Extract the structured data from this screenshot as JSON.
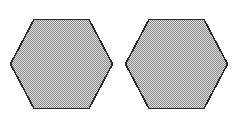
{
  "canvas": {
    "width": 232,
    "height": 116,
    "background_color": "#ffffff"
  },
  "figure": {
    "type": "geometric-shapes",
    "shape_count": 2,
    "shape_name": "hexagon"
  },
  "style": {
    "fill_color": "#b4b4b4",
    "fill_pattern": "checkerboard-dither",
    "dither_light_color": "#d8d8d8",
    "dither_dark_color": "#909090",
    "stroke_color": "#2b2b2b",
    "stroke_width": 1.6
  },
  "shapes": [
    {
      "id": "hexagon-left",
      "label": "Left hexagon",
      "center_x": 61.5,
      "center_y": 64,
      "width": 103,
      "height": 90,
      "orientation": "flat-top",
      "points": "34,19.5 89,19.5 112.5,64 89,108.5 34,108.5 10.5,64",
      "vertices": [
        {
          "x": 34,
          "y": 19.5
        },
        {
          "x": 89,
          "y": 19.5
        },
        {
          "x": 112.5,
          "y": 64
        },
        {
          "x": 89,
          "y": 108.5
        },
        {
          "x": 34,
          "y": 108.5
        },
        {
          "x": 10.5,
          "y": 64
        }
      ]
    },
    {
      "id": "hexagon-right",
      "label": "Right hexagon",
      "center_x": 176.5,
      "center_y": 64,
      "width": 103,
      "height": 90,
      "orientation": "flat-top",
      "points": "149,19.5 204,19.5 227.5,64 204,108.5 149,108.5 125.5,64",
      "vertices": [
        {
          "x": 149,
          "y": 19.5
        },
        {
          "x": 204,
          "y": 19.5
        },
        {
          "x": 227.5,
          "y": 64
        },
        {
          "x": 204,
          "y": 108.5
        },
        {
          "x": 149,
          "y": 108.5
        },
        {
          "x": 125.5,
          "y": 64
        }
      ]
    }
  ]
}
